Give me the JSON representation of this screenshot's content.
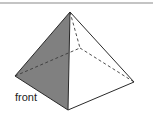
{
  "diagram": {
    "type": "square-pyramid",
    "label": "front",
    "colors": {
      "shaded_face": "#808080",
      "edge": "#2a2a2a",
      "hidden_edge": "#3a3a3a",
      "top_rule": "#8a8a8a",
      "background": "#ffffff"
    },
    "vertices": {
      "apex": [
        70,
        12
      ],
      "left": [
        15,
        76
      ],
      "front": [
        68,
        110
      ],
      "right": [
        134,
        82
      ],
      "back": [
        80,
        48
      ]
    },
    "solid_edges": [
      [
        "apex",
        "left"
      ],
      [
        "apex",
        "front"
      ],
      [
        "apex",
        "right"
      ],
      [
        "left",
        "front"
      ],
      [
        "front",
        "right"
      ]
    ],
    "hidden_edges": [
      [
        "apex",
        "back"
      ],
      [
        "left",
        "back"
      ],
      [
        "back",
        "right"
      ]
    ],
    "shaded_faces": [
      [
        "apex",
        "left",
        "front"
      ]
    ]
  }
}
